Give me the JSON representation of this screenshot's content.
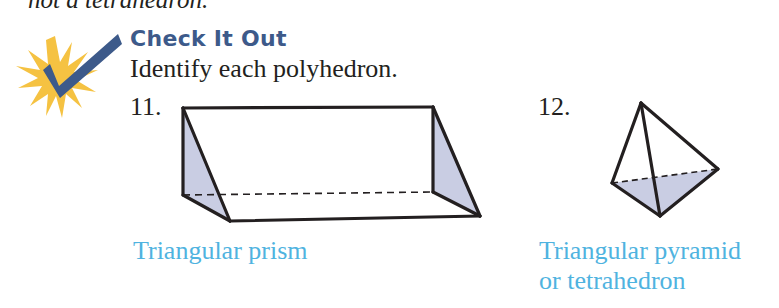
{
  "top_fragment": {
    "text": "not a tetrahedron."
  },
  "section": {
    "title": "Check It Out",
    "instruction": "Identify each polyhedron.",
    "icon": "checkmark-starburst-icon"
  },
  "exercises": [
    {
      "number": "11.",
      "figure": "triangular-prism",
      "answer": "Triangular prism"
    },
    {
      "number": "12.",
      "figure": "triangular-pyramid",
      "answer_line1": "Triangular pyramid",
      "answer_line2": "or tetrahedron"
    }
  ],
  "colors": {
    "title": "#3d5a8a",
    "answer": "#4fb3e0",
    "star": "#f5c242",
    "check": "#3d5a8a",
    "shade": "#c9cde3"
  }
}
